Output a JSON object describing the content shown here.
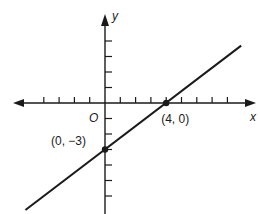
{
  "chart_data": {
    "type": "line",
    "title": "",
    "xlabel": "x",
    "ylabel": "y",
    "origin_label": "O",
    "xlim": [
      -6,
      9
    ],
    "ylim": [
      -7,
      4
    ],
    "grid": false,
    "series": [
      {
        "name": "line through (0, -3) and (4, 0)",
        "equation": "y = 3/4 x - 3",
        "x": [
          -5.2,
          8.9
        ],
        "y": [
          -6.9,
          3.7
        ]
      }
    ],
    "points": [
      {
        "x": 0,
        "y": -3,
        "label": "(0, −3)"
      },
      {
        "x": 4,
        "y": 0,
        "label": "(4, 0)"
      }
    ],
    "x_ticks": [
      -4,
      -3,
      -2,
      -1,
      1,
      2,
      3,
      4,
      5,
      6,
      7,
      8
    ],
    "y_ticks": [
      4,
      3,
      2,
      1,
      -1,
      -2,
      -3,
      -4,
      -5,
      -6
    ]
  }
}
